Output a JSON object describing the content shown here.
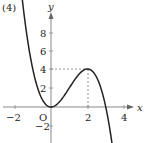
{
  "problem_label": "(4)",
  "origin_label": "O",
  "axes": {
    "x_label": "x",
    "y_label": "y"
  },
  "x_ticks": [
    "−2",
    "2",
    "4"
  ],
  "y_ticks": [
    "8",
    "6",
    "4",
    "2",
    "−2"
  ],
  "chart_data": {
    "type": "line",
    "title": "(4)",
    "function": "y = -x^3 + 3x^2",
    "xlabel": "x",
    "ylabel": "y",
    "xlim": [
      -2.5,
      4.5
    ],
    "ylim": [
      -3.5,
      10.5
    ],
    "x_ticks": [
      -2,
      2,
      4
    ],
    "y_ticks": [
      -2,
      2,
      4,
      6,
      8
    ],
    "grid": false,
    "annotations": [
      {
        "type": "dashed-guide",
        "point": [
          2,
          4
        ],
        "note": "local maximum"
      },
      {
        "type": "point",
        "point": [
          0,
          0
        ],
        "label": "O",
        "note": "local minimum at origin"
      }
    ],
    "series": [
      {
        "name": "y = -x^3 + 3x^2",
        "x": [
          -1.8,
          -1.5,
          -1.0,
          -0.5,
          0,
          0.5,
          1.0,
          1.5,
          2.0,
          2.5,
          3.0,
          3.3
        ],
        "values": [
          15.55,
          10.13,
          4.0,
          0.88,
          0,
          0.63,
          2.0,
          3.38,
          4.0,
          3.13,
          0,
          -3.27
        ]
      }
    ]
  }
}
